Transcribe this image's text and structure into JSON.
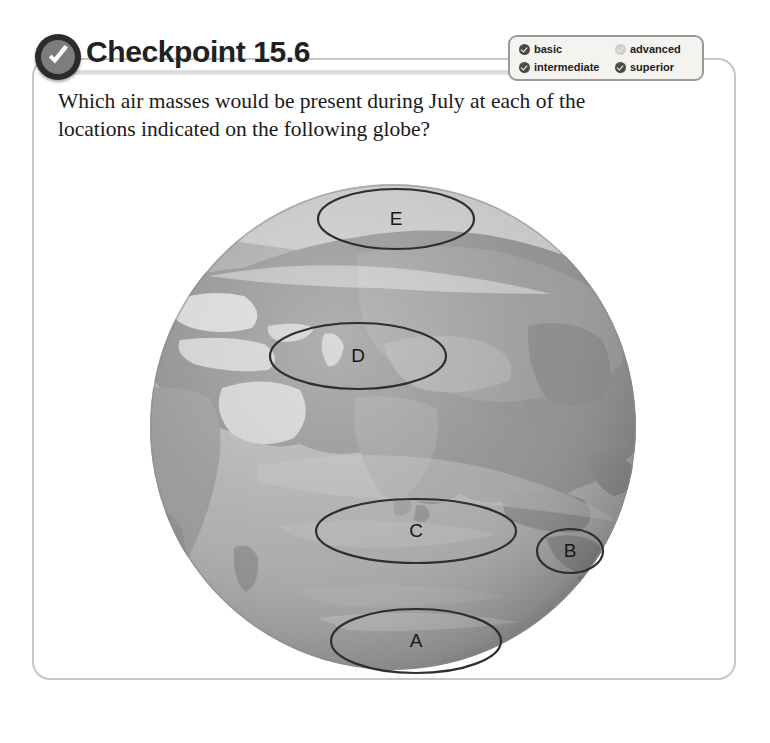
{
  "panel": {
    "title": "Checkpoint 15.6",
    "badge_icon": "check-circle-icon",
    "question": "Which air masses would be present during July at each of the locations indicated on the following globe?"
  },
  "legend": {
    "items": [
      {
        "label": "basic",
        "state": "filled"
      },
      {
        "label": "advanced",
        "state": "dim"
      },
      {
        "label": "intermediate",
        "state": "filled"
      },
      {
        "label": "superior",
        "state": "filled"
      }
    ]
  },
  "globe": {
    "alt": "greyscale satellite globe centered on Asia, Africa and the Indian Ocean",
    "markers": [
      {
        "id": "E",
        "label": "E",
        "cx": 248,
        "cy": 43,
        "rx": 78,
        "ry": 30
      },
      {
        "id": "D",
        "label": "D",
        "cx": 210,
        "cy": 180,
        "rx": 88,
        "ry": 33
      },
      {
        "id": "C",
        "label": "C",
        "cx": 268,
        "cy": 355,
        "rx": 100,
        "ry": 32
      },
      {
        "id": "B",
        "label": "B",
        "cx": 422,
        "cy": 375,
        "rx": 33,
        "ry": 22
      },
      {
        "id": "A",
        "label": "A",
        "cx": 268,
        "cy": 465,
        "rx": 85,
        "ry": 32
      }
    ]
  },
  "colors": {
    "panel_border": "#c3c7c9",
    "badge": "#2b2b2b",
    "title_text": "#212121",
    "legend_border": "#9a9a9a",
    "legend_bg": "#f4f3f0",
    "marker_stroke": "#2e2e2e"
  }
}
